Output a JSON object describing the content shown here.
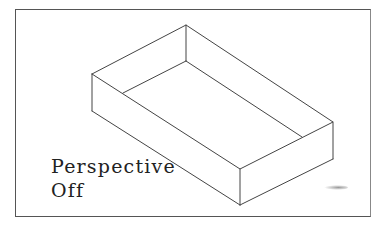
{
  "viewport": {
    "label_line1": "Perspective",
    "label_line2": "Off",
    "perspective_enabled": false
  },
  "colors": {
    "background": "#ffffff",
    "frame": "#555555",
    "edges": "#444444",
    "text": "#222222"
  }
}
